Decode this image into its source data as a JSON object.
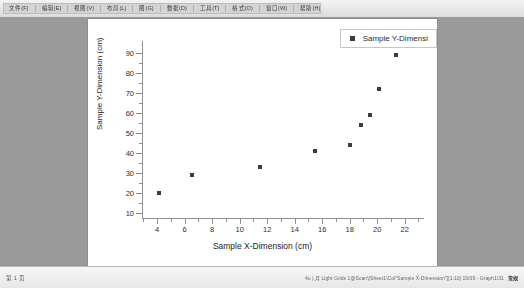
{
  "window": {
    "toolbar": {
      "menu_items": [
        "文件(F)",
        "编辑(E)",
        "视图(V)",
        "布局(L)",
        "图(G)",
        "数据(D)",
        "工具(T)",
        "格式(O)",
        "窗口(W)",
        "帮助(H)"
      ]
    },
    "statusbar": {
      "left_text": "第 1 页",
      "right_text": "4u | 月  Light Grids  1@Scan\\[Sheet1\\Col\"Sample X-Dimension\"][1:10]  15/09 - Graph1/31",
      "right_badge": "常规"
    }
  },
  "chart_data": {
    "type": "scatter",
    "title": "",
    "xlabel": "Sample X-Dimension (cm)",
    "ylabel": "Sample Y-Dimension (cm)",
    "legend": [
      {
        "name": "Sample Y-Dimensi",
        "marker_color": "#3b3b3b"
      }
    ],
    "legend_position": "top-right",
    "grid": false,
    "xlim": [
      2.9,
      23.4
    ],
    "ylim": [
      7.0,
      96.0
    ],
    "xticks": [
      4,
      6,
      8,
      10,
      12,
      14,
      16,
      18,
      20,
      22
    ],
    "yticks": [
      10,
      20,
      30,
      40,
      50,
      60,
      70,
      80,
      90
    ],
    "marker": "square",
    "marker_color": "#3d3d3d",
    "series": [
      {
        "name": "Sample Y-Dimensi",
        "points": [
          {
            "x": 4.1,
            "y": 20
          },
          {
            "x": 6.5,
            "y": 29
          },
          {
            "x": 11.5,
            "y": 33
          },
          {
            "x": 15.5,
            "y": 41
          },
          {
            "x": 18.0,
            "y": 44
          },
          {
            "x": 18.8,
            "y": 54
          },
          {
            "x": 19.5,
            "y": 59
          },
          {
            "x": 20.1,
            "y": 72
          },
          {
            "x": 21.4,
            "y": 89
          }
        ]
      }
    ]
  }
}
